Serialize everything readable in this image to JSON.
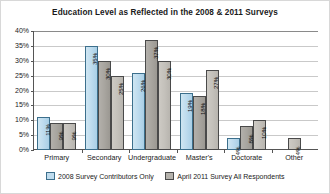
{
  "chart_data": {
    "type": "bar",
    "title": "Education Level as Reflected in the 2008 & 2011 Surveys",
    "xlabel": "",
    "ylabel": "",
    "ylim": [
      0,
      40
    ],
    "ytick_labels": [
      "40%",
      "35%",
      "30%",
      "25%",
      "20%",
      "15%",
      "10%",
      "5%",
      "0%"
    ],
    "ytick_values": [
      40,
      35,
      30,
      25,
      20,
      15,
      10,
      5,
      0
    ],
    "grid": true,
    "legend_position": "bottom",
    "categories": [
      "Primary",
      "Secondary",
      "Undergraduate",
      "Master's",
      "Doctorate",
      "Other"
    ],
    "series": [
      {
        "name": "2008 Survey Contributors Only",
        "color": "#bfdcee",
        "values": [
          11,
          35,
          26,
          19,
          4,
          null
        ],
        "labels": [
          "11%",
          "35%",
          "26%",
          "19%",
          "4%",
          ""
        ]
      },
      {
        "name": "April 2011 Survey All Respondents",
        "color": "#b5b2ac",
        "values": [
          9,
          30,
          37,
          18,
          8,
          null
        ],
        "labels": [
          "9%",
          "30%",
          "37%",
          "18%",
          "8%",
          ""
        ]
      },
      {
        "name": "April 2011 Survey All Respondents",
        "color": "#c4c1bb",
        "values": [
          9,
          25,
          30,
          27,
          10,
          4
        ],
        "labels": [
          "9%",
          "25%",
          "30%",
          "27%",
          "10%",
          "4%"
        ]
      }
    ]
  },
  "legend": {
    "items": [
      {
        "label": "2008 Survey Contributors Only"
      },
      {
        "label": "April 2011 Survey All Respondents"
      }
    ]
  }
}
